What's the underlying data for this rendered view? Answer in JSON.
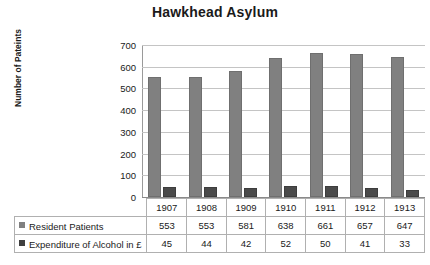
{
  "chart_data": {
    "type": "bar",
    "title": "Hawkhead Asylum",
    "xlabel": "",
    "ylabel": "Number of Pateints",
    "categories": [
      "1907",
      "1908",
      "1909",
      "1910",
      "1911",
      "1912",
      "1913"
    ],
    "series": [
      {
        "name": "Resident Patients",
        "values": [
          553,
          553,
          581,
          638,
          661,
          657,
          647
        ],
        "color": "#808080"
      },
      {
        "name": "Expenditure of Alcohol in £",
        "values": [
          45,
          44,
          42,
          52,
          50,
          41,
          33
        ],
        "color": "#4a4a4a"
      }
    ],
    "ylim": [
      0,
      700
    ],
    "yticks": [
      "0",
      "100",
      "200",
      "300",
      "400",
      "500",
      "600",
      "700"
    ],
    "grid": true,
    "legend_position": "data-table"
  },
  "colors": {
    "primary_series": "#808080",
    "secondary_series": "#4a4a4a",
    "gridline": "#c4c4c4",
    "axis": "#8a8a8a",
    "table_border": "#b0b0b0",
    "text": "#1a1a1a",
    "background": "#ffffff"
  }
}
